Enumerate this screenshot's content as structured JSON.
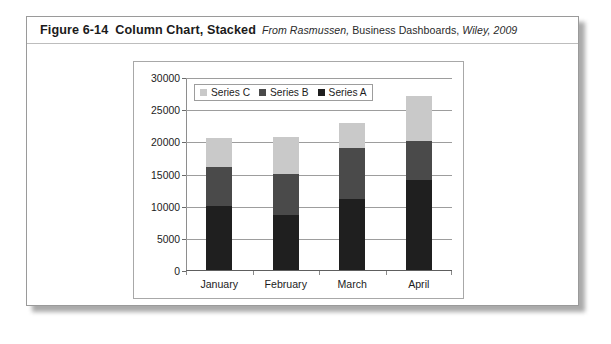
{
  "figure": {
    "number": "Figure 6-14",
    "title": "Column Chart, Stacked",
    "source_italic_1": "From Rasmussen,",
    "source_roman": "Business Dashboards,",
    "source_italic_2": "Wiley, 2009"
  },
  "colors": {
    "series_a": "#1f1f1f",
    "series_b": "#4a4a4a",
    "series_c": "#c9c9c9",
    "gridline": "#9d9d9d",
    "axis": "#6a6a6a",
    "panel_border": "#a8a8a8",
    "card_border": "#9a9a9a",
    "text": "#1c1c1c"
  },
  "chart_data": {
    "type": "bar",
    "stacked": true,
    "title": "",
    "xlabel": "",
    "ylabel": "",
    "categories": [
      "January",
      "February",
      "March",
      "April"
    ],
    "series": [
      {
        "name": "Series A",
        "color": "#1f1f1f",
        "values": [
          10000,
          8600,
          11000,
          14000
        ]
      },
      {
        "name": "Series B",
        "color": "#4a4a4a",
        "values": [
          6000,
          6400,
          8000,
          6100
        ]
      },
      {
        "name": "Series C",
        "color": "#c9c9c9",
        "values": [
          4600,
          5600,
          3900,
          6900
        ]
      }
    ],
    "stack_totals": [
      20600,
      20600,
      22900,
      27000
    ],
    "ylim": [
      0,
      30000
    ],
    "ytick_values": [
      0,
      5000,
      10000,
      15000,
      20000,
      25000,
      30000
    ],
    "ytick_labels": [
      "0",
      "5000",
      "10000",
      "15000",
      "20000",
      "25000",
      "30000"
    ],
    "grid": true,
    "legend": {
      "position": "top-left-inside",
      "entries": [
        "Series C",
        "Series B",
        "Series A"
      ]
    }
  }
}
